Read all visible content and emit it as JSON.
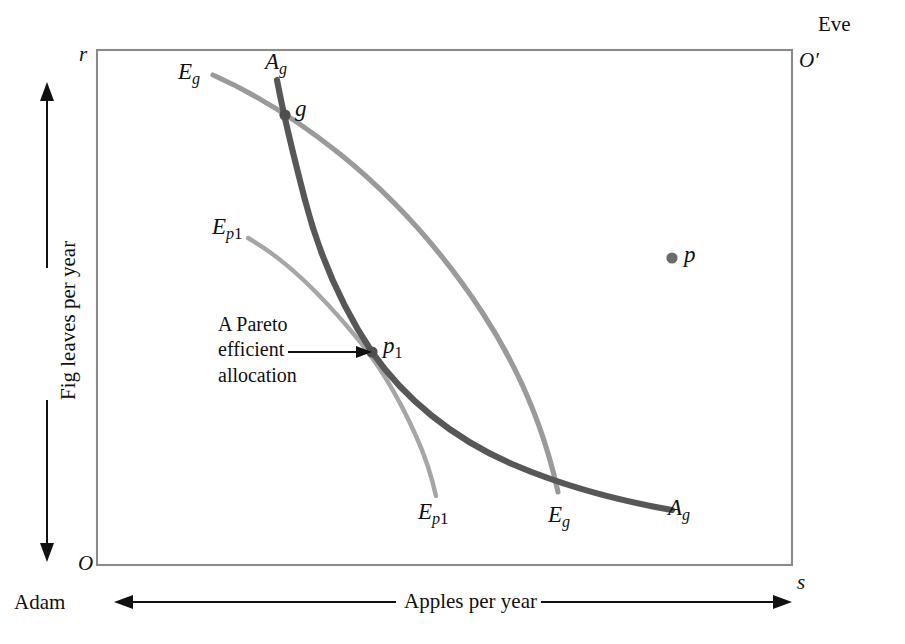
{
  "figure": {
    "type": "edgeworth-box",
    "title_text": "",
    "corners": {
      "origin_adam": "O",
      "origin_eve": "O′",
      "top_left_tick": "r",
      "bottom_right_tick": "s"
    },
    "axes": {
      "x_title": "Apples per year",
      "y_title": "Fig leaves per year",
      "left_person": "Adam",
      "right_person": "Eve"
    },
    "curves": [
      {
        "id": "Eg",
        "label_start": "E",
        "label_start_sub": "g",
        "label_end": "E",
        "label_end_sub": "g",
        "color": "#9a9a9a",
        "role": "eve-indifference-curve-through-g"
      },
      {
        "id": "Ep1",
        "label_start": "E",
        "label_start_sub": "p",
        "label_start_subsub": "1",
        "label_end": "E",
        "label_end_sub": "p",
        "label_end_subsub": "1",
        "color": "#a6a6a6",
        "role": "eve-indifference-curve-through-p1"
      },
      {
        "id": "Ag",
        "label_start": "A",
        "label_start_sub": "g",
        "label_end": "A",
        "label_end_sub": "g",
        "color": "#575757",
        "role": "adam-indifference-curve-through-g"
      }
    ],
    "points": [
      {
        "id": "g",
        "label": "g",
        "label_sub": "",
        "x": 285,
        "y": 115
      },
      {
        "id": "p",
        "label": "p",
        "label_sub": "",
        "x": 672,
        "y": 258
      },
      {
        "id": "p1",
        "label": "p",
        "label_sub": "1",
        "x": 372,
        "y": 352
      }
    ],
    "annotation": {
      "line1": "A Pareto",
      "line2": "efficient",
      "line3": "allocation",
      "points_to": "p1"
    },
    "colors": {
      "box_border": "#8a8a8a",
      "curve_dark": "#575757",
      "curve_light": "#9a9a9a",
      "text": "#101010",
      "arrow": "#111111",
      "background": "#ffffff"
    },
    "box_geometry": {
      "left": 97,
      "top": 50,
      "right": 792,
      "bottom": 565
    }
  }
}
